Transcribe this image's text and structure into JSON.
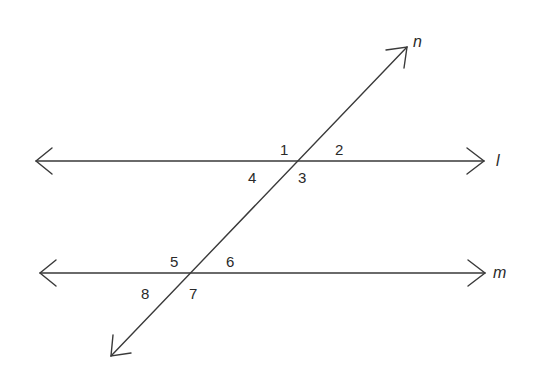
{
  "diagram": {
    "lines": [
      {
        "id": "l",
        "label": "l",
        "type": "line",
        "from": [
          36,
          161
        ],
        "to": [
          484,
          161
        ],
        "label_pos": [
          496,
          166
        ]
      },
      {
        "id": "m",
        "label": "m",
        "type": "line",
        "from": [
          40,
          273
        ],
        "to": [
          485,
          273
        ],
        "label_pos": [
          493,
          278
        ]
      },
      {
        "id": "n",
        "label": "n",
        "type": "transversal",
        "from": [
          111,
          356
        ],
        "to": [
          407,
          47
        ],
        "label_pos": [
          413,
          47
        ]
      }
    ],
    "angles": [
      {
        "label": "1",
        "pos": [
          280,
          155
        ]
      },
      {
        "label": "2",
        "pos": [
          335,
          155
        ]
      },
      {
        "label": "3",
        "pos": [
          298,
          183
        ]
      },
      {
        "label": "4",
        "pos": [
          248,
          183
        ]
      },
      {
        "label": "5",
        "pos": [
          170,
          267
        ]
      },
      {
        "label": "6",
        "pos": [
          226,
          267
        ]
      },
      {
        "label": "7",
        "pos": [
          189,
          299
        ]
      },
      {
        "label": "8",
        "pos": [
          141,
          299
        ]
      }
    ],
    "intersections": [
      {
        "lines": [
          "l",
          "n"
        ],
        "point": [
          298,
          161
        ]
      },
      {
        "lines": [
          "m",
          "n"
        ],
        "point": [
          191,
          273
        ]
      }
    ]
  }
}
